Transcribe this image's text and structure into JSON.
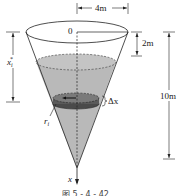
{
  "diagram": {
    "type": "inverted-cone-tank",
    "labels": {
      "top_radius": "4m",
      "origin": "0",
      "water_depth_from_top": "2m",
      "height": "10m",
      "slice_depth": "x",
      "slice_depth_sub": "i",
      "slice_depth_sup": "*",
      "slice_thickness": "Δx",
      "slice_radius": "r",
      "slice_radius_sub": "i",
      "axis": "x"
    },
    "caption": "图 5 - 4 - 42",
    "colors": {
      "water_fill": "#b8b8b8",
      "slice_fill": "#6a6a6a",
      "line": "#222222",
      "background": "#ffffff"
    }
  }
}
